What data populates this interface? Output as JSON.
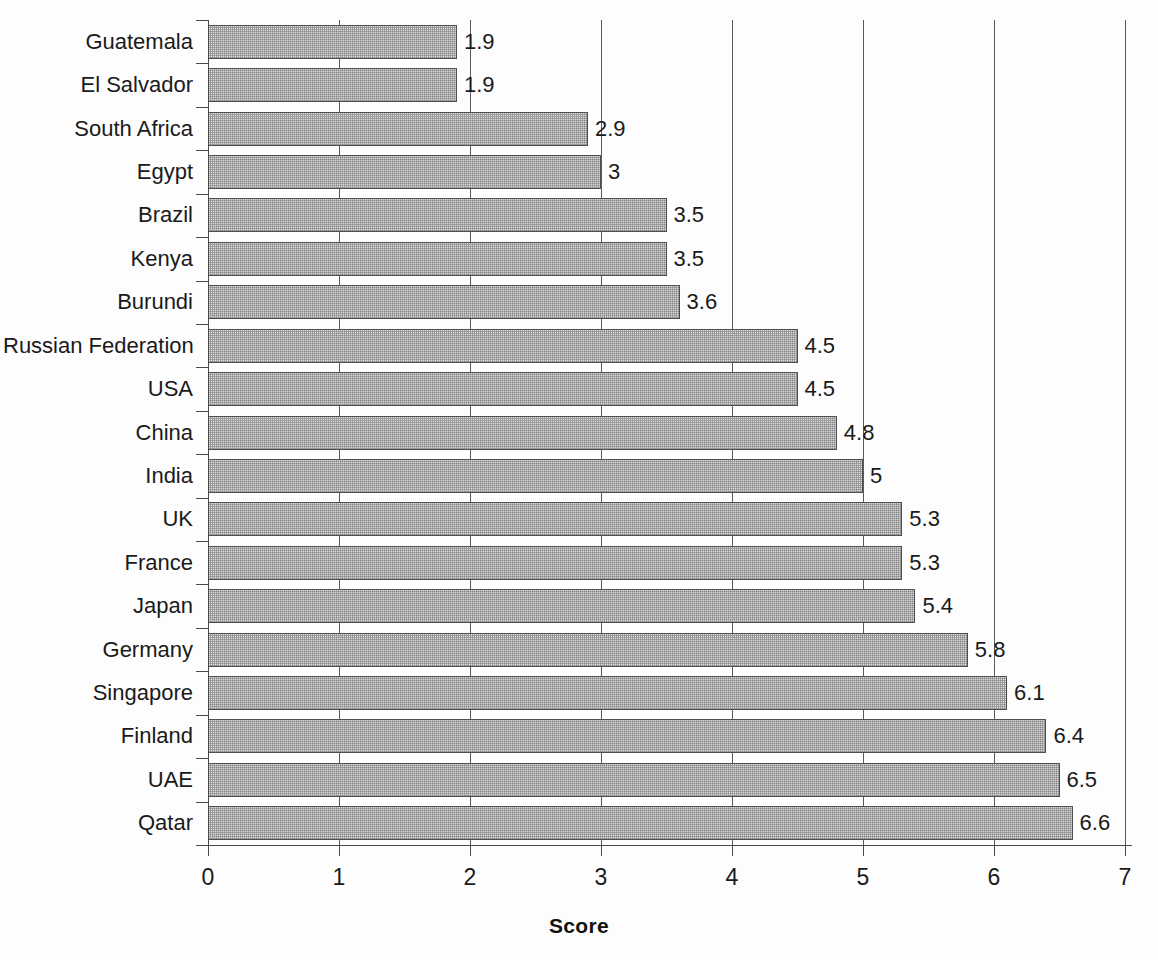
{
  "chart_data": {
    "type": "bar",
    "orientation": "horizontal",
    "title": "",
    "xlabel": "Score",
    "ylabel": "",
    "xlim": [
      0,
      7
    ],
    "xticks": [
      "0",
      "1",
      "2",
      "3",
      "4",
      "5",
      "6",
      "7"
    ],
    "grid": "vertical",
    "legend": "none",
    "categories": [
      "Guatemala",
      "El Salvador",
      "South Africa",
      "Egypt",
      "Brazil",
      "Kenya",
      "Burundi",
      "Russian Federation",
      "USA",
      "China",
      "India",
      "UK",
      "France",
      "Japan",
      "Germany",
      "Singapore",
      "Finland",
      "UAE",
      "Qatar"
    ],
    "values": [
      1.9,
      1.9,
      2.9,
      3,
      3.5,
      3.5,
      3.6,
      4.5,
      4.5,
      4.8,
      5,
      5.3,
      5.3,
      5.4,
      5.8,
      6.1,
      6.4,
      6.5,
      6.6
    ],
    "value_labels": [
      "1.9",
      "1.9",
      "2.9",
      "3",
      "3.5",
      "3.5",
      "3.6",
      "4.5",
      "4.5",
      "4.8",
      "5",
      "5.3",
      "5.3",
      "5.4",
      "5.8",
      "6.1",
      "6.4",
      "6.5",
      "6.6"
    ],
    "colors": {
      "bar_fill": "#dcdcdc",
      "bar_edge": "#4f4f4f",
      "axis": "#4a4a4a",
      "grid": "#5a5a5a",
      "text": "#1a1a1a",
      "background": "#fdfdfd"
    }
  }
}
